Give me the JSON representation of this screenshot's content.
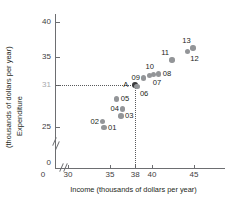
{
  "chart_data": {
    "type": "scatter",
    "title": "",
    "xlabel": "Income (thousands of dollars per year)",
    "ylabel_line1": "Expenditure",
    "ylabel_line2": "(thousands of dollars per year)",
    "xlim": [
      29,
      46
    ],
    "ylim": [
      24,
      41
    ],
    "x_ticks": [
      {
        "label": "0",
        "value": null,
        "origin": true
      },
      {
        "label": "30",
        "value": 30
      },
      {
        "label": "35",
        "value": 35
      },
      {
        "label": "38",
        "value": 38
      },
      {
        "label": "40",
        "value": 40
      },
      {
        "label": "45",
        "value": 45
      }
    ],
    "y_ticks": [
      {
        "label": "40",
        "value": 40,
        "muted": false
      },
      {
        "label": "35",
        "value": 35,
        "muted": false
      },
      {
        "label": "31",
        "value": 31,
        "muted": true
      },
      {
        "label": "25",
        "value": 25,
        "muted": false
      },
      {
        "label": "0",
        "value": null,
        "muted": false,
        "origin": true
      }
    ],
    "axis_break_x": true,
    "axis_break_y": true,
    "grid": false,
    "legend": null,
    "reference_lines": {
      "horizontal_value": 31,
      "vertical_value": 38,
      "style": "dotted"
    },
    "points": [
      {
        "label": "01",
        "x": 34.3,
        "y": 24.9,
        "label_pos": "right",
        "highlight": false
      },
      {
        "label": "02",
        "x": 34.1,
        "y": 25.8,
        "label_pos": "left",
        "highlight": false
      },
      {
        "label": "03",
        "x": 36.3,
        "y": 26.6,
        "label_pos": "right",
        "highlight": false
      },
      {
        "label": "04",
        "x": 36.5,
        "y": 27.6,
        "label_pos": "left",
        "highlight": false
      },
      {
        "label": "05",
        "x": 35.8,
        "y": 29.0,
        "label_pos": "right",
        "highlight": false
      },
      {
        "label": "A",
        "x": 38.0,
        "y": 31.0,
        "label_pos": "left",
        "highlight": true
      },
      {
        "label": "06",
        "x": 38.2,
        "y": 30.8,
        "label_pos": "below-right",
        "highlight": false
      },
      {
        "label": "09",
        "x": 39.0,
        "y": 32.0,
        "label_pos": "left",
        "highlight": false
      },
      {
        "label": "10",
        "x": 39.7,
        "y": 32.4,
        "label_pos": "above",
        "highlight": false
      },
      {
        "label": "07",
        "x": 40.2,
        "y": 32.5,
        "label_pos": "below",
        "highlight": false
      },
      {
        "label": "08",
        "x": 40.8,
        "y": 32.6,
        "label_pos": "right",
        "highlight": false
      },
      {
        "label": "11",
        "x": 42.4,
        "y": 34.6,
        "label_pos": "above-left",
        "highlight": false
      },
      {
        "label": "12",
        "x": 44.2,
        "y": 35.8,
        "label_pos": "below-right",
        "highlight": false
      },
      {
        "label": "13",
        "x": 44.9,
        "y": 36.3,
        "label_pos": "above-left",
        "highlight": false
      }
    ],
    "colors": {
      "point": "#939598",
      "point_highlight": "#3a3a3c",
      "axis": "#6d6e71",
      "text": "#231f20",
      "muted_text": "#a7a9ac",
      "reference_line": "#58595b"
    }
  }
}
